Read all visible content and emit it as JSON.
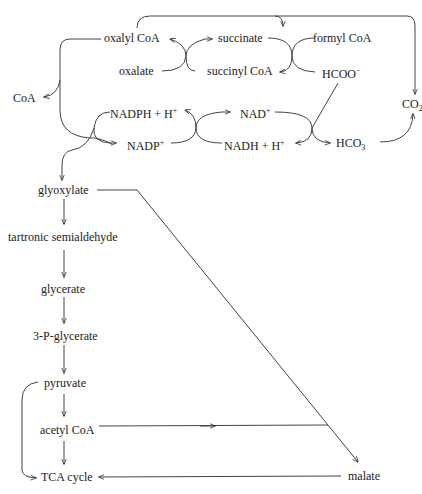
{
  "diagram": {
    "type": "metabolic-pathway",
    "nodes": {
      "oxalyl_coa": "oxalyl CoA",
      "succinate": "succinate",
      "formyl_coa": "formyl CoA",
      "oxalate": "oxalate",
      "succinyl_coa": "succinyl CoA",
      "hcoo": "HCOO",
      "hcoo_sup": "−",
      "coa": "CoA",
      "nadph": "NADPH + H",
      "nadph_sup": "+",
      "nad": "NAD",
      "nad_sup": "+",
      "co2": "CO",
      "co2_sub": "2",
      "nadp": "NADP",
      "nadp_sup": "+",
      "nadh": "NADH + H",
      "nadh_sup": "+",
      "hco3": "HCO",
      "hco3_sub": "3",
      "glyoxylate": "glyoxylate",
      "tartronic": "tartronic semialdehyde",
      "glycerate": "glycerate",
      "p_glycerate": "3-P-glycerate",
      "pyruvate": "pyruvate",
      "acetyl_coa": "acetyl CoA",
      "tca": "TCA cycle",
      "malate": "malate"
    },
    "edges": [
      {
        "from": "oxalate",
        "to": "oxalyl CoA",
        "coupled": "succinyl CoA → succinate"
      },
      {
        "from": "formyl CoA",
        "to": "HCOO−",
        "coupled": "succinate → succinyl CoA"
      },
      {
        "from": "oxalyl CoA",
        "to": "formyl CoA"
      },
      {
        "from": "oxalyl CoA",
        "to": "CoA"
      },
      {
        "from": "oxalyl CoA",
        "to": "glyoxylate",
        "coupled": "NADPH + H+ → NADP+"
      },
      {
        "from": "NADP+",
        "to": "NADPH + H+",
        "coupled": "NAD+ → NADH + H+"
      },
      {
        "from": "HCOO−",
        "to": "HCO3",
        "coupled": "NAD+ → NADH + H+"
      },
      {
        "from": "HCO3",
        "to": "CO2"
      },
      {
        "from": "formyl CoA",
        "to": "CO2"
      },
      {
        "from": "glyoxylate",
        "to": "tartronic semialdehyde"
      },
      {
        "from": "tartronic semialdehyde",
        "to": "glycerate"
      },
      {
        "from": "glycerate",
        "to": "3-P-glycerate"
      },
      {
        "from": "3-P-glycerate",
        "to": "pyruvate"
      },
      {
        "from": "pyruvate",
        "to": "acetyl CoA"
      },
      {
        "from": "acetyl CoA",
        "to": "TCA cycle"
      },
      {
        "from": "pyruvate",
        "to": "TCA cycle"
      },
      {
        "from": "glyoxylate",
        "to": "malate"
      },
      {
        "from": "acetyl CoA",
        "to": "malate"
      },
      {
        "from": "malate",
        "to": "TCA cycle"
      }
    ]
  }
}
